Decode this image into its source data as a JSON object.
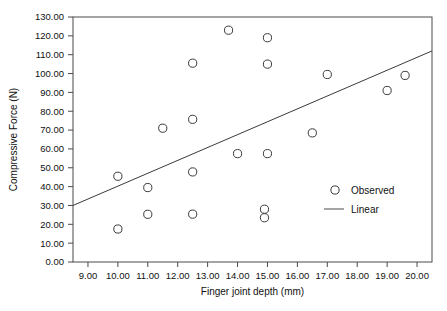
{
  "chart_data": {
    "type": "scatter",
    "title": "",
    "xlabel": "Finger joint depth (mm)",
    "ylabel": "Compressive Force (N)",
    "xlim": [
      8.5,
      20.5
    ],
    "ylim": [
      0,
      130
    ],
    "grid": false,
    "xticks": [
      "9.00",
      "10.00",
      "11.00",
      "12.00",
      "13.00",
      "14.00",
      "15.00",
      "16.00",
      "17.00",
      "18.00",
      "19.00",
      "20.00"
    ],
    "xtick_values": [
      9,
      10,
      11,
      12,
      13,
      14,
      15,
      16,
      17,
      18,
      19,
      20
    ],
    "yticks": [
      "0.00",
      "10.00",
      "20.00",
      "30.00",
      "40.00",
      "50.00",
      "60.00",
      "70.00",
      "80.00",
      "90.00",
      "100.00",
      "110.00",
      "120.00",
      "130.00"
    ],
    "ytick_values": [
      0,
      10,
      20,
      30,
      40,
      50,
      60,
      70,
      80,
      90,
      100,
      110,
      120,
      130
    ],
    "series": [
      {
        "name": "Observed",
        "type": "scatter",
        "marker": "open-circle",
        "color": "#3a3a3a",
        "points": [
          {
            "x": 10.0,
            "y": 45.5
          },
          {
            "x": 10.0,
            "y": 17.5
          },
          {
            "x": 11.0,
            "y": 39.5
          },
          {
            "x": 11.0,
            "y": 25.3
          },
          {
            "x": 11.5,
            "y": 71.0
          },
          {
            "x": 12.5,
            "y": 105.5
          },
          {
            "x": 12.5,
            "y": 75.7
          },
          {
            "x": 12.5,
            "y": 47.8
          },
          {
            "x": 12.5,
            "y": 25.4
          },
          {
            "x": 13.7,
            "y": 123.0
          },
          {
            "x": 14.0,
            "y": 57.5
          },
          {
            "x": 14.9,
            "y": 28.0
          },
          {
            "x": 14.9,
            "y": 23.5
          },
          {
            "x": 15.0,
            "y": 119.0
          },
          {
            "x": 15.0,
            "y": 105.0
          },
          {
            "x": 15.0,
            "y": 57.5
          },
          {
            "x": 16.5,
            "y": 68.5
          },
          {
            "x": 17.0,
            "y": 99.5
          },
          {
            "x": 19.0,
            "y": 91.0
          },
          {
            "x": 19.6,
            "y": 99.0
          }
        ]
      },
      {
        "name": "Linear",
        "type": "line",
        "color": "#3a3a3a",
        "fit_endpoints": [
          {
            "x": 8.5,
            "y": 30.0
          },
          {
            "x": 20.5,
            "y": 112.0
          }
        ]
      }
    ],
    "legend": {
      "position": "inside-lower-right",
      "entries": [
        {
          "label": "Observed",
          "marker": "open-circle"
        },
        {
          "label": "Linear",
          "marker": "line"
        }
      ]
    }
  }
}
